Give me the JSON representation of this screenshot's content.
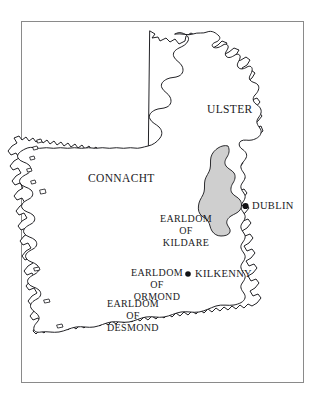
{
  "figure": {
    "frame_color": "#8a8a8a",
    "background_color": "#ffffff",
    "coast_line_color": "#16161a",
    "shaded_region_color": "#cfcfcf"
  },
  "provinces": [
    {
      "name": "ulster",
      "label": "ULSTER"
    },
    {
      "name": "connacht",
      "label": "CONNACHT"
    }
  ],
  "earldoms": [
    {
      "name": "kildare",
      "lines": [
        "EARLDOM",
        "OF",
        "KILDARE"
      ],
      "line1": "EARLDOM",
      "line2": "OF",
      "line3": "KILDARE",
      "shaded": true
    },
    {
      "name": "ormond",
      "lines": [
        "EARLDOM",
        "OF",
        "ORMOND"
      ],
      "line1": "EARLDOM",
      "line2": "OF",
      "line3": "ORMOND",
      "shaded": false
    },
    {
      "name": "desmond",
      "lines": [
        "EARLDOM",
        "OF",
        "DESMOND"
      ],
      "line1": "EARLDOM",
      "line2": "OF",
      "line3": "DESMOND",
      "shaded": false
    }
  ],
  "cities": [
    {
      "name": "dublin",
      "label": "DUBLIN",
      "marker": "filled-dot"
    },
    {
      "name": "kilkenny",
      "label": "KILKENNY",
      "marker": "filled-dot"
    }
  ]
}
